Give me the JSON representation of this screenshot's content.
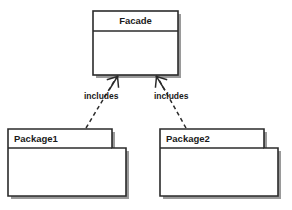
{
  "diagram": {
    "type": "uml-class-package-diagram",
    "pattern_name": "Facade",
    "background_color": "#ffffff",
    "line_color": "#2b2b2b",
    "shadow_color": "#9a9a9a",
    "nodes": [
      {
        "id": "facade",
        "kind": "class",
        "name": "Facade",
        "compartments": [
          "Facade",
          ""
        ],
        "x": 93,
        "y": 11,
        "width": 85,
        "height": 64,
        "title_divider_y": 31
      },
      {
        "id": "package1",
        "kind": "package",
        "name": "Package1",
        "tab": {
          "x": 8,
          "y": 129,
          "width": 104,
          "height": 19
        },
        "body": {
          "x": 8,
          "y": 148,
          "width": 118,
          "height": 48
        }
      },
      {
        "id": "package2",
        "kind": "package",
        "name": "Package2",
        "tab": {
          "x": 160,
          "y": 129,
          "width": 104,
          "height": 19
        },
        "body": {
          "x": 160,
          "y": 148,
          "width": 118,
          "height": 48
        }
      }
    ],
    "edges": [
      {
        "id": "edge-package1-facade",
        "from": "package1",
        "to": "facade",
        "label": "includes",
        "style": "dashed",
        "arrow": "open",
        "label_x": 84,
        "label_y": 90,
        "path": "M 86 128 L 116 77",
        "arrow_points": "111,88 118,76 109,78 M 118,76 L 119,86"
      },
      {
        "id": "edge-package2-facade",
        "from": "package2",
        "to": "facade",
        "label": "includes",
        "style": "dashed",
        "arrow": "open",
        "label_x": 153,
        "label_y": 90,
        "path": "M 185 128 L 158 77",
        "arrow_points": "163,88 156,76 165,79 M 156,76 L 155,86"
      }
    ]
  }
}
